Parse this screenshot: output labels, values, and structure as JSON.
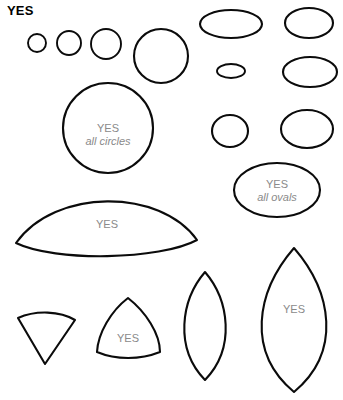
{
  "figure": {
    "title": "YES",
    "background_color": "#ffffff",
    "stroke_color": "#0b0b0b",
    "label_color": "#8a8a8a",
    "width": 343,
    "height": 400
  },
  "labels": {
    "circle_group": {
      "main": "YES",
      "sub": "all circles"
    },
    "oval_group": {
      "main": "YES",
      "sub": "all ovals"
    },
    "dome": "YES",
    "reuleaux": "YES",
    "big_vesica": "YES"
  },
  "shapes": [
    {
      "id": "circle-1",
      "kind": "circle",
      "label": ""
    },
    {
      "id": "circle-2",
      "kind": "circle",
      "label": ""
    },
    {
      "id": "circle-3",
      "kind": "circle",
      "label": ""
    },
    {
      "id": "circle-4",
      "kind": "circle",
      "label": ""
    },
    {
      "id": "circle-5",
      "kind": "circle",
      "label": "YES all circles"
    },
    {
      "id": "oval-1",
      "kind": "ellipse",
      "label": ""
    },
    {
      "id": "oval-2",
      "kind": "ellipse",
      "label": ""
    },
    {
      "id": "oval-3",
      "kind": "ellipse",
      "label": ""
    },
    {
      "id": "oval-4",
      "kind": "ellipse",
      "label": ""
    },
    {
      "id": "oval-5",
      "kind": "ellipse",
      "label": ""
    },
    {
      "id": "oval-6",
      "kind": "ellipse",
      "label": ""
    },
    {
      "id": "oval-7",
      "kind": "ellipse",
      "label": "YES all ovals"
    },
    {
      "id": "dome",
      "kind": "lens-horizontal",
      "label": "YES"
    },
    {
      "id": "wedge",
      "kind": "sector",
      "label": ""
    },
    {
      "id": "reuleaux",
      "kind": "reuleaux-triangle",
      "label": "YES"
    },
    {
      "id": "vesica-small",
      "kind": "lens-vertical",
      "label": ""
    },
    {
      "id": "vesica-large",
      "kind": "lens-vertical",
      "label": "YES"
    }
  ]
}
